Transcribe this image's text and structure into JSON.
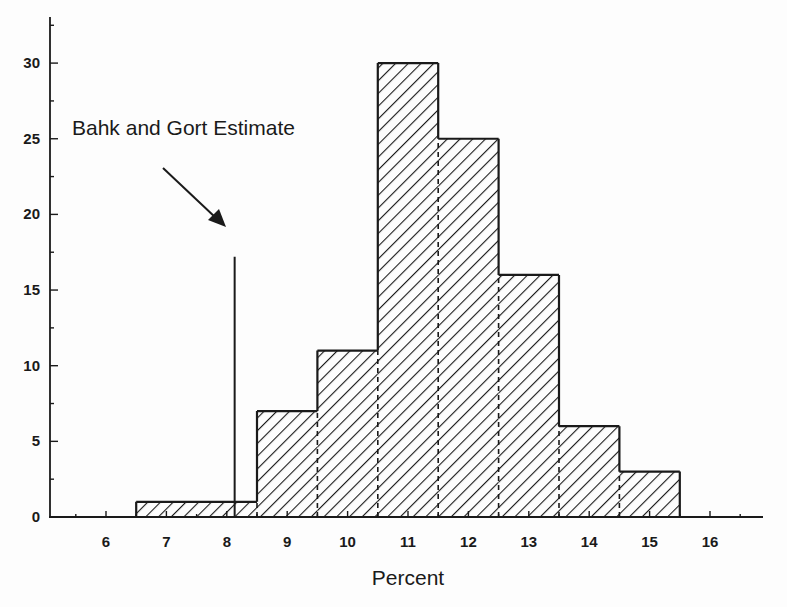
{
  "chart_data": {
    "type": "bar",
    "subtype": "histogram",
    "title": "",
    "xlabel": "Percent",
    "ylabel": "",
    "xlim": [
      5.1,
      16.9
    ],
    "ylim": [
      0,
      33
    ],
    "x_ticks": [
      6,
      7,
      8,
      9,
      10,
      11,
      12,
      13,
      14,
      15,
      16
    ],
    "y_ticks": [
      0,
      5,
      10,
      15,
      20,
      25,
      30
    ],
    "bins": [
      {
        "from": 6.5,
        "to": 8.5,
        "value": 1
      },
      {
        "from": 8.5,
        "to": 9.5,
        "value": 7
      },
      {
        "from": 9.5,
        "to": 10.5,
        "value": 11
      },
      {
        "from": 10.5,
        "to": 11.5,
        "value": 30
      },
      {
        "from": 11.5,
        "to": 12.5,
        "value": 25
      },
      {
        "from": 12.5,
        "to": 13.5,
        "value": 16
      },
      {
        "from": 13.5,
        "to": 14.5,
        "value": 6
      },
      {
        "from": 14.5,
        "to": 15.5,
        "value": 3
      }
    ],
    "categories": [
      "6.5-8.5",
      "8.5-9.5",
      "9.5-10.5",
      "10.5-11.5",
      "11.5-12.5",
      "12.5-13.5",
      "13.5-14.5",
      "14.5-15.5"
    ],
    "values": [
      1,
      7,
      11,
      30,
      25,
      16,
      6,
      3
    ],
    "annotations": [
      {
        "text": "Bahk and Gort Estimate",
        "type": "vertical-line-with-arrow",
        "x": 8.13,
        "line_height": 17.2
      }
    ],
    "grid": false,
    "legend": null,
    "fill": "diagonal-hatch"
  }
}
